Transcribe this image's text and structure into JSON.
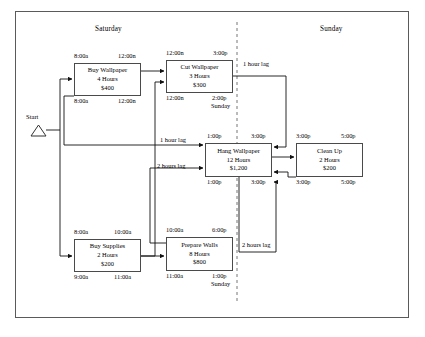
{
  "diagram": {
    "type": "precedence-network",
    "day_dividers": [
      {
        "name": "saturday-label",
        "text": "Saturday",
        "x": 95,
        "y": 28
      },
      {
        "name": "sunday-label",
        "text": "Sunday",
        "x": 320,
        "y": 28
      }
    ],
    "start": {
      "label": "Start",
      "x": 23,
      "y": 118
    },
    "tasks": [
      {
        "id": "buy-wallpaper",
        "name": "Buy Wallpaper",
        "duration": "4 Hours",
        "cost": "$400",
        "early_start": "8:00a",
        "early_finish": "12:00n",
        "late_start": "8:00a",
        "late_finish": "12:00n",
        "late_start_day": "",
        "late_finish_day": "",
        "box": {
          "x": 74,
          "y": 63,
          "w": 67,
          "h": 33
        }
      },
      {
        "id": "cut-wallpaper",
        "name": "Cut Wallpaper",
        "duration": "3 Hours",
        "cost": "$300",
        "early_start": "12:00n",
        "early_finish": "3:00p",
        "late_start": "12:00n",
        "late_finish": "2:00p",
        "late_start_day": "",
        "late_finish_day": "Sunday",
        "box": {
          "x": 166,
          "y": 60,
          "w": 67,
          "h": 33
        }
      },
      {
        "id": "hang-wallpaper",
        "name": "Hang Wallpaper",
        "duration": "12 Hours",
        "cost": "$1,200",
        "early_start": "1:00p",
        "early_finish": "3:00p",
        "late_start": "1:00p",
        "late_finish": "3:00p",
        "late_start_day": "",
        "late_finish_day": "",
        "box": {
          "x": 205,
          "y": 143,
          "w": 67,
          "h": 34
        }
      },
      {
        "id": "clean-up",
        "name": "Clean Up",
        "duration": "2 Hours",
        "cost": "$200",
        "early_start": "3:00p",
        "early_finish": "5:00p",
        "late_start": "3:00p",
        "late_finish": "5:00p",
        "late_start_day": "",
        "late_finish_day": "",
        "box": {
          "x": 296,
          "y": 143,
          "w": 67,
          "h": 34
        }
      },
      {
        "id": "buy-supplies",
        "name": "Buy Supplies",
        "duration": "2 Hours",
        "cost": "$200",
        "early_start": "8:00a",
        "early_finish": "10:00a",
        "late_start": "9:00a",
        "late_finish": "11:00a",
        "late_start_day": "",
        "late_finish_day": "",
        "box": {
          "x": 74,
          "y": 239,
          "w": 67,
          "h": 33
        }
      },
      {
        "id": "prepare-walls",
        "name": "Prepare Walls",
        "duration": "8 Hours",
        "cost": "$800",
        "early_start": "10:00a",
        "early_finish": "6:00p",
        "late_start": "11:00a",
        "late_finish": "1:00p",
        "late_start_day": "",
        "late_finish_day": "Sunday",
        "box": {
          "x": 166,
          "y": 237,
          "w": 67,
          "h": 34
        }
      }
    ],
    "lags": [
      {
        "id": "lag-cut-to-hang-top",
        "text": "1 hour lag",
        "x": 243,
        "y": 61
      },
      {
        "id": "lag-cut-to-hang-left",
        "text": "1 hour lag",
        "x": 160,
        "y": 137
      },
      {
        "id": "lag-prepare-to-hang",
        "text": "2 hours lag",
        "x": 157,
        "y": 163
      },
      {
        "id": "lag-hang-to-prepare",
        "text": "2 hours lag",
        "x": 242,
        "y": 242
      }
    ]
  }
}
